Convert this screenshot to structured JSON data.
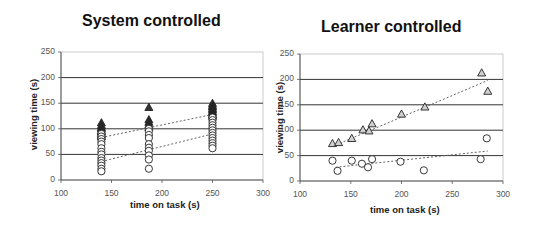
{
  "charts": [
    {
      "title": "System controlled",
      "xlabel": "time on task (s)",
      "ylabel": "viewing time (s)",
      "xticks": [
        "100",
        "150",
        "200",
        "250",
        "300"
      ],
      "yticks": [
        "0",
        "50",
        "100",
        "150",
        "200",
        "250"
      ]
    },
    {
      "title": "Learner controlled",
      "xlabel": "time on task (s)",
      "ylabel": "viewing time (s)",
      "xticks": [
        "100",
        "150",
        "200",
        "250",
        "300"
      ],
      "yticks": [
        "0",
        "50",
        "100",
        "150",
        "200",
        "250"
      ]
    }
  ],
  "chart_data": [
    {
      "type": "scatter",
      "title": "System controlled",
      "xlabel": "time on task (s)",
      "ylabel": "viewing time (s)",
      "xlim": [
        100,
        300
      ],
      "ylim": [
        0,
        250
      ],
      "grid": "horizontal",
      "legend": "none",
      "series": [
        {
          "name": "triangles (filled)",
          "marker": "triangle-filled",
          "points": [
            [
              140,
              112
            ],
            [
              140,
              107
            ],
            [
              140,
              103
            ],
            [
              140,
              100
            ],
            [
              140,
              97
            ],
            [
              140,
              94
            ],
            [
              140,
              91
            ],
            [
              140,
              88
            ],
            [
              140,
              85
            ],
            [
              187,
              142
            ],
            [
              187,
              118
            ],
            [
              187,
              113
            ],
            [
              187,
              108
            ],
            [
              187,
              103
            ],
            [
              250,
              150
            ],
            [
              250,
              146
            ],
            [
              250,
              143
            ],
            [
              250,
              140
            ],
            [
              250,
              137
            ],
            [
              250,
              134
            ],
            [
              250,
              131
            ],
            [
              250,
              128
            ],
            [
              250,
              125
            ]
          ],
          "trendline": [
            [
              140,
              83
            ],
            [
              250,
              128
            ]
          ]
        },
        {
          "name": "circles (open)",
          "marker": "circle-open",
          "points": [
            [
              140,
              90
            ],
            [
              140,
              85
            ],
            [
              140,
              80
            ],
            [
              140,
              75
            ],
            [
              140,
              70
            ],
            [
              140,
              62
            ],
            [
              140,
              55
            ],
            [
              140,
              50
            ],
            [
              140,
              43
            ],
            [
              140,
              38
            ],
            [
              140,
              33
            ],
            [
              140,
              28
            ],
            [
              140,
              22
            ],
            [
              140,
              17
            ],
            [
              187,
              100
            ],
            [
              187,
              95
            ],
            [
              187,
              88
            ],
            [
              187,
              82
            ],
            [
              187,
              70
            ],
            [
              187,
              63
            ],
            [
              187,
              57
            ],
            [
              187,
              48
            ],
            [
              187,
              40
            ],
            [
              187,
              22
            ],
            [
              250,
              122
            ],
            [
              250,
              117
            ],
            [
              250,
              112
            ],
            [
              250,
              107
            ],
            [
              250,
              102
            ],
            [
              250,
              97
            ],
            [
              250,
              92
            ],
            [
              250,
              87
            ],
            [
              250,
              82
            ],
            [
              250,
              77
            ],
            [
              250,
              72
            ],
            [
              250,
              67
            ],
            [
              250,
              62
            ]
          ],
          "trendline": [
            [
              140,
              36
            ],
            [
              250,
              90
            ]
          ]
        }
      ]
    },
    {
      "type": "scatter",
      "title": "Learner controlled",
      "xlabel": "time on task (s)",
      "ylabel": "viewing time (s)",
      "xlim": [
        100,
        300
      ],
      "ylim": [
        0,
        250
      ],
      "grid": "horizontal",
      "legend": "none",
      "series": [
        {
          "name": "triangles (open)",
          "marker": "triangle-open",
          "points": [
            [
              132,
              74
            ],
            [
              138,
              76
            ],
            [
              151,
              84
            ],
            [
              162,
              101
            ],
            [
              168,
              99
            ],
            [
              171,
              113
            ],
            [
              200,
              132
            ],
            [
              223,
              146
            ],
            [
              279,
              213
            ],
            [
              285,
              177
            ]
          ],
          "trendline": [
            [
              132,
              68
            ],
            [
              285,
              198
            ]
          ]
        },
        {
          "name": "circles (open)",
          "marker": "circle-open",
          "points": [
            [
              132,
              40
            ],
            [
              137,
              20
            ],
            [
              151,
              40
            ],
            [
              161,
              34
            ],
            [
              167,
              27
            ],
            [
              171,
              43
            ],
            [
              199,
              38
            ],
            [
              222,
              21
            ],
            [
              278,
              43
            ],
            [
              284,
              84
            ]
          ],
          "trendline": [
            [
              135,
              27
            ],
            [
              285,
              59
            ]
          ]
        }
      ]
    }
  ]
}
